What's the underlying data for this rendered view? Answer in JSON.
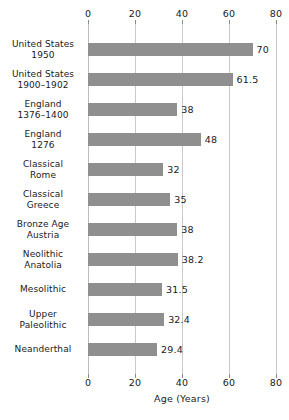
{
  "chart_data": {
    "type": "bar",
    "orientation": "horizontal",
    "title": "",
    "xlabel": "Age (Years)",
    "ylabel": "",
    "xlim": [
      0,
      80
    ],
    "xticks": [
      0,
      20,
      40,
      60,
      80
    ],
    "xtick_labels": [
      "0",
      "20",
      "40",
      "60",
      "80"
    ],
    "grid": true,
    "grid_axis": "x",
    "legend": false,
    "bar_color": "#8f8f8f",
    "categories": [
      "United States\n1950",
      "United States\n1900–1902",
      "England\n1376–1400",
      "England\n1276",
      "Classical\nRome",
      "Classical\nGreece",
      "Bronze Age\nAustria",
      "Neolithic\nAnatolia",
      "Mesolithic",
      "Upper\nPaleolithic",
      "Neanderthal"
    ],
    "values": [
      70,
      61.5,
      38,
      48,
      32,
      35,
      38,
      38.2,
      31.5,
      32.4,
      29.4
    ],
    "value_labels": [
      "70",
      "61.5",
      "38",
      "48",
      "32",
      "35",
      "38",
      "38.2",
      "31.5",
      "32.4",
      "29.4"
    ]
  },
  "rows": [
    {
      "line1": "United States",
      "line2": "1950",
      "value": 70,
      "label": "70"
    },
    {
      "line1": "United States",
      "line2": "1900–1902",
      "value": 61.5,
      "label": "61.5"
    },
    {
      "line1": "England",
      "line2": "1376–1400",
      "value": 38,
      "label": "38"
    },
    {
      "line1": "England",
      "line2": "1276",
      "value": 48,
      "label": "48"
    },
    {
      "line1": "Classical",
      "line2": "Rome",
      "value": 32,
      "label": "32"
    },
    {
      "line1": "Classical",
      "line2": "Greece",
      "value": 35,
      "label": "35"
    },
    {
      "line1": "Bronze Age",
      "line2": "Austria",
      "value": 38,
      "label": "38"
    },
    {
      "line1": "Neolithic",
      "line2": "Anatolia",
      "value": 38.2,
      "label": "38.2"
    },
    {
      "line1": "Mesolithic",
      "line2": "",
      "value": 31.5,
      "label": "31.5"
    },
    {
      "line1": "Upper",
      "line2": "Paleolithic",
      "value": 32.4,
      "label": "32.4"
    },
    {
      "line1": "Neanderthal",
      "line2": "",
      "value": 29.4,
      "label": "29.4"
    }
  ],
  "axis": {
    "ticks": [
      "0",
      "20",
      "40",
      "60",
      "80"
    ],
    "title": "Age (Years)"
  }
}
